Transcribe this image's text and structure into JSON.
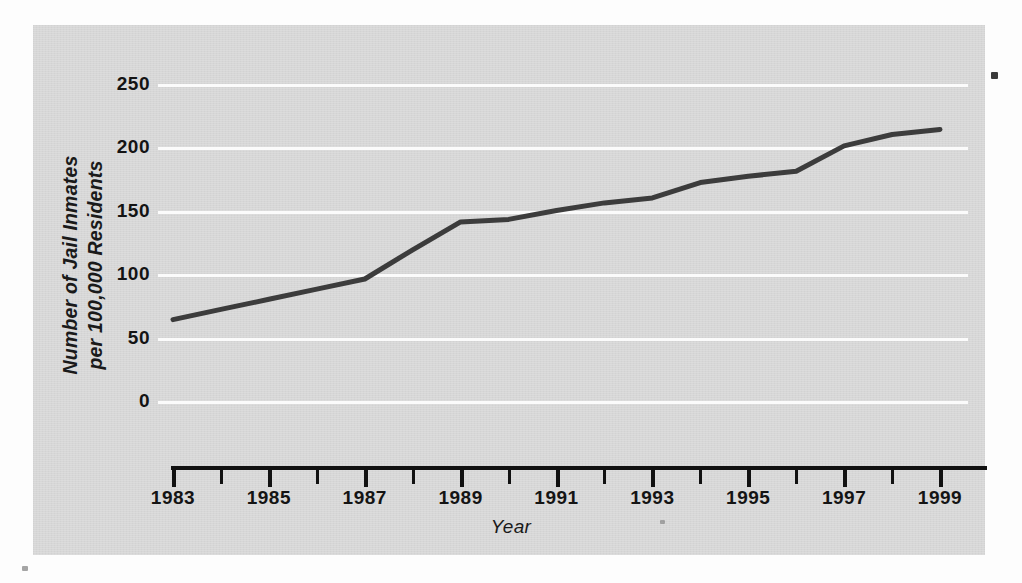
{
  "chart_data": {
    "type": "line",
    "title": "",
    "subtitle": "",
    "xlabel": "Year",
    "ylabel": "Number of Jail Inmates\nper 100,000 Residents",
    "x": [
      1983,
      1984,
      1985,
      1986,
      1987,
      1988,
      1989,
      1990,
      1991,
      1992,
      1993,
      1994,
      1995,
      1996,
      1997,
      1998,
      1999
    ],
    "values": [
      65,
      73,
      81,
      89,
      97,
      120,
      142,
      144,
      151,
      157,
      161,
      173,
      178,
      182,
      202,
      211,
      215
    ],
    "series": [
      {
        "name": "Jail inmates per 100,000 residents",
        "values": [
          65,
          73,
          81,
          89,
          97,
          120,
          142,
          144,
          151,
          157,
          161,
          173,
          178,
          182,
          202,
          211,
          215
        ]
      }
    ],
    "xlim": [
      1983,
      1999
    ],
    "ylim": [
      0,
      250
    ],
    "ytick_values": [
      0,
      50,
      100,
      150,
      200,
      250
    ],
    "ytick_labels": [
      "0",
      "50",
      "100",
      "150",
      "200",
      "250"
    ],
    "xtick_values": [
      1983,
      1984,
      1985,
      1986,
      1987,
      1988,
      1989,
      1990,
      1991,
      1992,
      1993,
      1994,
      1995,
      1996,
      1997,
      1998,
      1999
    ],
    "xtick_labels": [
      "1983",
      "",
      "1985",
      "",
      "1987",
      "",
      "1989",
      "",
      "1991",
      "",
      "1993",
      "",
      "1995",
      "",
      "1997",
      "",
      "1999"
    ],
    "xtick_labels_shown": [
      "1983",
      "1985",
      "1987",
      "1989",
      "1991",
      "1993",
      "1995",
      "1997",
      "1999"
    ],
    "grid": "horizontal",
    "grid_color": "#fbfbfb",
    "legend": "none",
    "legend_position": "none",
    "annotations": [],
    "line_color": "#3c3c3c",
    "line_width": 5,
    "marker": "none",
    "plot_background": "#d6d6d6",
    "page_background": "#fdfdfd"
  },
  "axes": {
    "y_title_line1": "Number of Jail Inmates",
    "y_title_line2": "per 100,000 Residents",
    "x_title": "Year"
  }
}
